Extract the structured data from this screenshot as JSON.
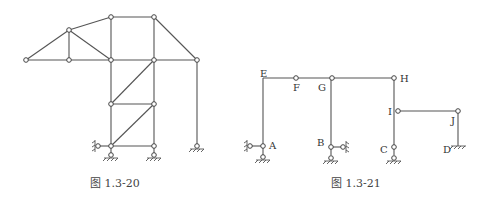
{
  "figures": [
    {
      "id": "fig-1-3-20",
      "caption": "图 1.3-20",
      "type": "truss-frame",
      "nodes": [
        {
          "id": "n1",
          "label": ""
        },
        {
          "id": "n2",
          "label": ""
        },
        {
          "id": "n3",
          "label": ""
        },
        {
          "id": "n4",
          "label": ""
        },
        {
          "id": "n5",
          "label": ""
        },
        {
          "id": "n6",
          "label": ""
        },
        {
          "id": "n7",
          "label": ""
        },
        {
          "id": "n8",
          "label": ""
        },
        {
          "id": "n9",
          "label": ""
        },
        {
          "id": "n10",
          "label": ""
        },
        {
          "id": "n11",
          "label": ""
        },
        {
          "id": "n12",
          "label": ""
        },
        {
          "id": "n13",
          "label": ""
        }
      ],
      "supports": [
        "fixed-hinge",
        "fixed-hinge",
        "fixed-hinge",
        "horizontal-link"
      ]
    },
    {
      "id": "fig-1-3-21",
      "caption": "图 1.3-21",
      "type": "frame",
      "node_labels": [
        "E",
        "F",
        "G",
        "H",
        "I",
        "J",
        "A",
        "B",
        "C",
        "D"
      ],
      "supports": [
        {
          "node": "A",
          "kind": "hinge-with-horizontal-link"
        },
        {
          "node": "B",
          "kind": "hinge-with-horizontal-link"
        },
        {
          "node": "C",
          "kind": "fixed-hinge"
        },
        {
          "node": "D",
          "kind": "fixed-clamp"
        }
      ]
    }
  ]
}
